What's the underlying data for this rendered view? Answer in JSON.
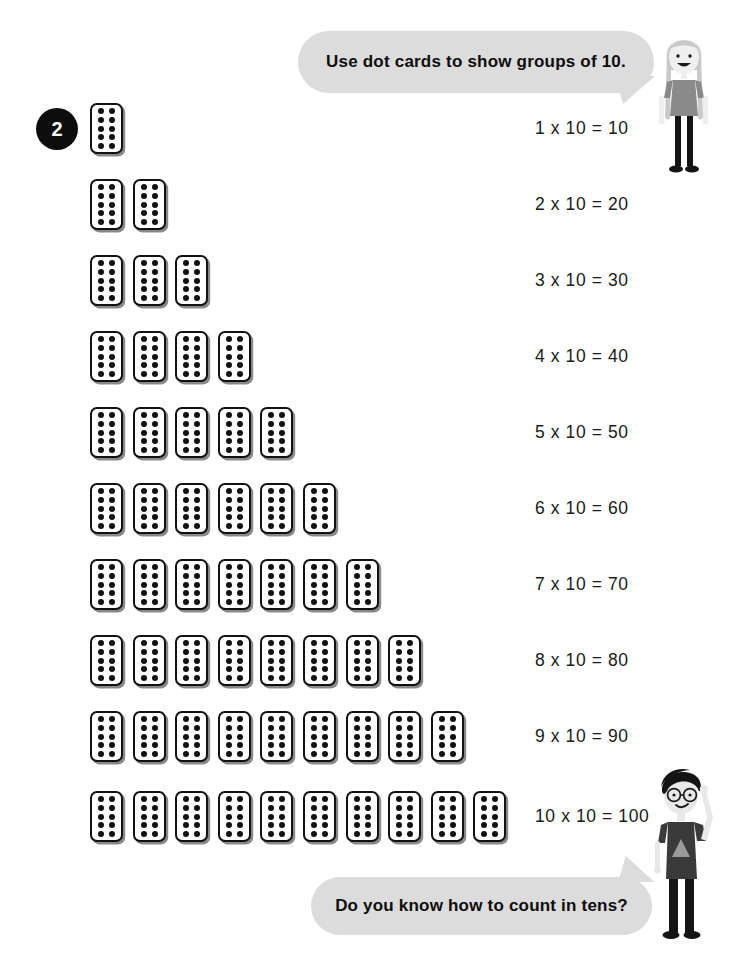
{
  "worksheet": {
    "exercise_number": "2",
    "background_color": "#ffffff",
    "ink_color": "#111111",
    "bubble_color": "#dcdcdc"
  },
  "speech_bubbles": [
    {
      "id": "top",
      "speaker": "girl-character",
      "text": "Use dot cards to show groups of 10.",
      "tail_direction": "down-right"
    },
    {
      "id": "bottom",
      "speaker": "boy-character",
      "text": "Do you know how to count in tens?",
      "tail_direction": "up-right"
    }
  ],
  "dot_card": {
    "dots_per_card": 10,
    "dot_columns": 2,
    "dot_rows": 5,
    "card_fill": "#ffffff",
    "card_border": "#111111",
    "dot_color": "#111111"
  },
  "rows": [
    {
      "cards": 1,
      "equation": "1 x 10 = 10",
      "multiplier": 1,
      "product": 10,
      "top": 103
    },
    {
      "cards": 2,
      "equation": "2 x 10 = 20",
      "multiplier": 2,
      "product": 20,
      "top": 179
    },
    {
      "cards": 3,
      "equation": "3 x 10 = 30",
      "multiplier": 3,
      "product": 30,
      "top": 255
    },
    {
      "cards": 4,
      "equation": "4 x 10 = 40",
      "multiplier": 4,
      "product": 40,
      "top": 331
    },
    {
      "cards": 5,
      "equation": "5 x 10 = 50",
      "multiplier": 5,
      "product": 50,
      "top": 407
    },
    {
      "cards": 6,
      "equation": "6 x 10 = 60",
      "multiplier": 6,
      "product": 60,
      "top": 483
    },
    {
      "cards": 7,
      "equation": "7 x 10 = 70",
      "multiplier": 7,
      "product": 70,
      "top": 559
    },
    {
      "cards": 8,
      "equation": "8 x 10 = 80",
      "multiplier": 8,
      "product": 80,
      "top": 635
    },
    {
      "cards": 9,
      "equation": "9 x 10 = 90",
      "multiplier": 9,
      "product": 90,
      "top": 711
    },
    {
      "cards": 10,
      "equation": "10 x 10 = 100",
      "multiplier": 10,
      "product": 100,
      "top": 791
    }
  ],
  "characters": [
    {
      "id": "girl",
      "name": "girl-character",
      "hair_color": "#c9c9c9",
      "skin_color": "#efefef",
      "top_color": "#8a8a8a",
      "legs_color": "#141414"
    },
    {
      "id": "boy",
      "name": "boy-character",
      "hair_color": "#141414",
      "skin_color": "#e8e8e8",
      "top_color": "#3a3a3a",
      "legs_color": "#141414"
    }
  ],
  "icons": {
    "badge": "circle-number-badge",
    "bubble": "speech-bubble-icon",
    "card": "dot-card-icon"
  }
}
